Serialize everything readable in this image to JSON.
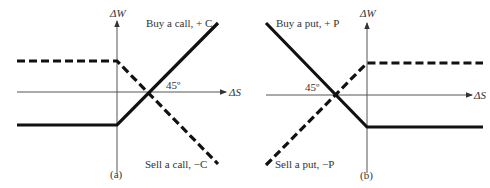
{
  "panels": [
    {
      "id": "a",
      "caption": "(a)",
      "y_axis_label": "ΔW",
      "x_axis_label": "ΔS",
      "angle_label": "45º",
      "solid_line": {
        "label": "Buy a call, + C",
        "description": "flat loss below strike, rises at 45° above strike"
      },
      "dashed_line": {
        "label": "Sell a call, −C",
        "description": "flat gain below strike, falls at 45° above strike"
      }
    },
    {
      "id": "b",
      "caption": "(b)",
      "y_axis_label": "ΔW",
      "x_axis_label": "ΔS",
      "angle_label": "45º",
      "solid_line": {
        "label": "Buy a put, + P",
        "description": "falls at 45° below strike, flat loss above strike"
      },
      "dashed_line": {
        "label": "Sell a put, −P",
        "description": "rises at 45° below strike, flat gain above strike"
      }
    }
  ],
  "colors": {
    "line": "#111111",
    "axis": "#555555",
    "text": "#333333",
    "background": "#ffffff"
  }
}
